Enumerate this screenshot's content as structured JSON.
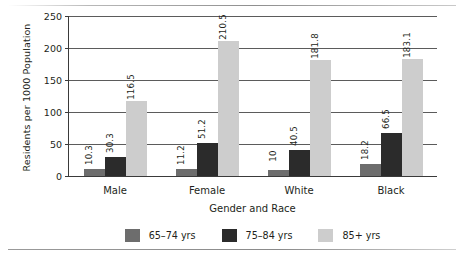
{
  "rules": {
    "top": "",
    "bottom": ""
  },
  "chart_data": {
    "type": "bar",
    "title": "",
    "xlabel": "Gender and Race",
    "ylabel": "Residents per 1000 Population",
    "categories": [
      "Male",
      "Female",
      "White",
      "Black"
    ],
    "ylim": [
      0,
      250
    ],
    "yticks": [
      0,
      50,
      100,
      150,
      200,
      250
    ],
    "ytick_labels": [
      "0",
      "50",
      "100",
      "150",
      "200",
      "250"
    ],
    "grid": true,
    "legend_position": "bottom",
    "series": [
      {
        "name": "65–74 yrs",
        "color": "#6d6d6d",
        "values": [
          10.3,
          11.2,
          10,
          18.2
        ],
        "labels": [
          "10.3",
          "11.2",
          "10",
          "18.2"
        ]
      },
      {
        "name": "75–84 yrs",
        "color": "#2b2b2b",
        "values": [
          30.3,
          51.2,
          40.5,
          66.5
        ],
        "labels": [
          "30.3",
          "51.2",
          "40.5",
          "66.5"
        ]
      },
      {
        "name": "85+ yrs",
        "color": "#cdcdcd",
        "values": [
          116.5,
          210.5,
          181.8,
          183.1
        ],
        "labels": [
          "116.5",
          "210.5",
          "181.8",
          "183.1"
        ]
      }
    ]
  }
}
